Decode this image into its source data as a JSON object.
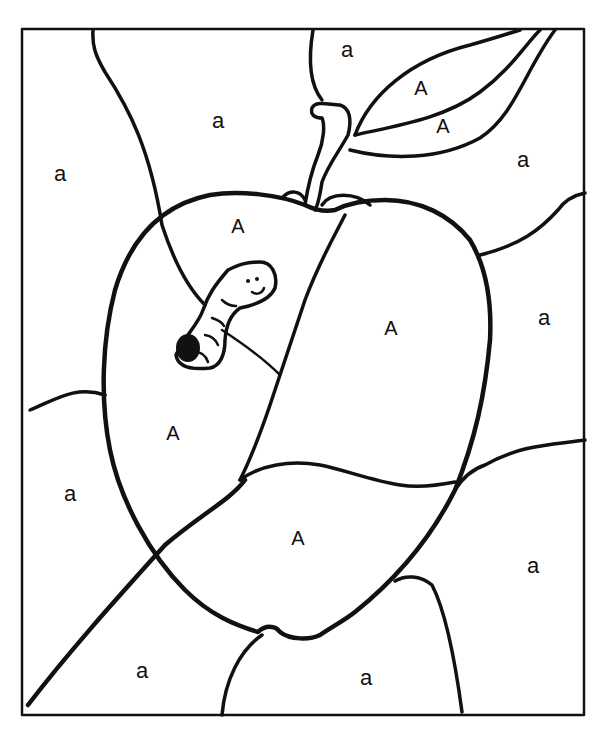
{
  "page": {
    "border_color": "#111111",
    "background_color": "#ffffff"
  },
  "legend_letters": [
    "A",
    "a"
  ],
  "labels": [
    {
      "id": "bg-top-left",
      "text": "a",
      "x": 60,
      "y": 175
    },
    {
      "id": "bg-top-center",
      "text": "a",
      "x": 218,
      "y": 122
    },
    {
      "id": "bg-top-right-corner",
      "text": "a",
      "x": 347,
      "y": 51
    },
    {
      "id": "leaf-upper",
      "text": "A",
      "x": 421,
      "y": 90
    },
    {
      "id": "leaf-lower",
      "text": "A",
      "x": 443,
      "y": 128
    },
    {
      "id": "bg-right-upper",
      "text": "a",
      "x": 523,
      "y": 161
    },
    {
      "id": "apple-top",
      "text": "A",
      "x": 238,
      "y": 228
    },
    {
      "id": "apple-right",
      "text": "A",
      "x": 391,
      "y": 330
    },
    {
      "id": "bg-right-middle",
      "text": "a",
      "x": 544,
      "y": 319
    },
    {
      "id": "apple-left",
      "text": "A",
      "x": 173,
      "y": 435
    },
    {
      "id": "bg-left-middle",
      "text": "a",
      "x": 70,
      "y": 495
    },
    {
      "id": "apple-bottom",
      "text": "A",
      "x": 298,
      "y": 540
    },
    {
      "id": "bg-right-lower",
      "text": "a",
      "x": 533,
      "y": 567
    },
    {
      "id": "bg-bottom-left",
      "text": "a",
      "x": 142,
      "y": 672
    },
    {
      "id": "bg-bottom-center",
      "text": "a",
      "x": 366,
      "y": 679
    }
  ]
}
